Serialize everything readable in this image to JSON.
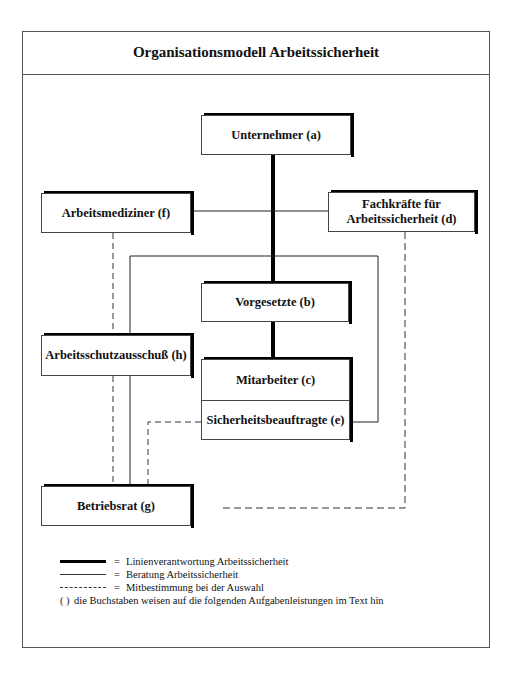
{
  "title": "Organisationsmodell Arbeitssicherheit",
  "nodes": {
    "unternehmer": "Unternehmer (a)",
    "vorgesetzte": "Vorgesetzte (b)",
    "mitarbeiter": "Mitarbeiter (c)",
    "sicherheitsbeauftragte": "Sicherheitsbeauftragte (e)",
    "fachkraefte_line1": "Fachkräfte für",
    "fachkraefte_line2": "Arbeitssicherheit (d)",
    "arbeitsmediziner": "Arbeitsmediziner (f)",
    "betriebsrat": "Betriebsrat (g)",
    "arbeitsschutzausschuss": "Arbeitsschutzausschuß (h)"
  },
  "edges": [
    {
      "from": "Unternehmer (a)",
      "to": "Vorgesetzte (b)",
      "type": "thick"
    },
    {
      "from": "Vorgesetzte (b)",
      "to": "Mitarbeiter (c)",
      "type": "thick"
    },
    {
      "from": "Arbeitsmediziner (f)",
      "to": "Fachkräfte für Arbeitssicherheit (d)",
      "type": "thin"
    },
    {
      "from": "Arbeitsmediziner (f)",
      "to": "Betriebsrat (g)",
      "type": "dashed"
    },
    {
      "from": "Sicherheitsbeauftragte (e)",
      "to": "Betriebsrat (g)",
      "type": "thin-loop"
    },
    {
      "from": "Sicherheitsbeauftragte (e)",
      "to": "Betriebsrat (g)",
      "type": "dashed"
    },
    {
      "from": "Fachkräfte für Arbeitssicherheit (d)",
      "to": "Betriebsrat (g)",
      "type": "dashed"
    }
  ],
  "legend": {
    "items": [
      {
        "symbol": "thick-line",
        "eq": "=",
        "label": "Linienverantwortung Arbeitssicherheit"
      },
      {
        "symbol": "thin-line",
        "eq": "=",
        "label": "Beratung Arbeitssicherheit"
      },
      {
        "symbol": "dashed-line",
        "eq": "=",
        "label": "Mitbestimmung bei der Auswahl"
      }
    ],
    "note_paren": "( )",
    "note": "die Buchstaben weisen auf die folgenden Aufgabenleistungen im Text hin"
  }
}
